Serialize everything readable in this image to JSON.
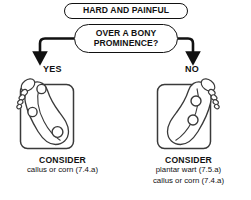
{
  "diagram": {
    "type": "decision-flowchart",
    "title_node": {
      "label": "HARD AND PAINFUL"
    },
    "decision_node": {
      "line1": "OVER A BONY",
      "line2": "PROMINENCE?"
    },
    "colors": {
      "ink": "#111111",
      "background": "#ffffff",
      "illustration_line": "#3a3a3a"
    },
    "branches": [
      {
        "answer": "YES",
        "panel_name": "foot-illustration-yes",
        "illustration": "foot-plantar-view-with-lesion-markers",
        "lesion_marker_count": 3,
        "caption": {
          "heading": "CONSIDER",
          "details": [
            "callus or corn (7.4.a)"
          ]
        }
      },
      {
        "answer": "NO",
        "panel_name": "foot-illustration-no",
        "illustration": "foot-plantar-view-mirrored-with-lesion-markers",
        "lesion_marker_count": 2,
        "caption": {
          "heading": "CONSIDER",
          "details": [
            "plantar wart (7.5.a)",
            "callus or corn (7.4.a)"
          ]
        }
      }
    ]
  }
}
